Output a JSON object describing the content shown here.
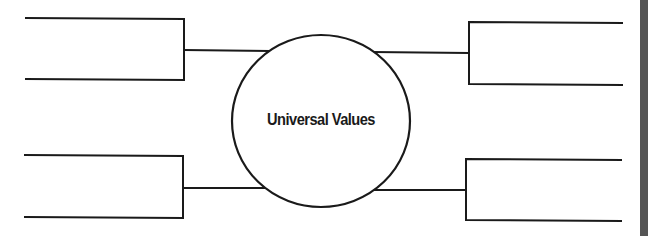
{
  "diagram": {
    "center_label": "Universal Values",
    "colors": {
      "stroke": "#1a1a1a",
      "background": "#ffffff",
      "edge_bar": "#555555"
    },
    "branches": [
      {
        "position": "top-left",
        "text": ""
      },
      {
        "position": "bottom-left",
        "text": ""
      },
      {
        "position": "top-right",
        "text": ""
      },
      {
        "position": "bottom-right",
        "text": ""
      }
    ]
  }
}
